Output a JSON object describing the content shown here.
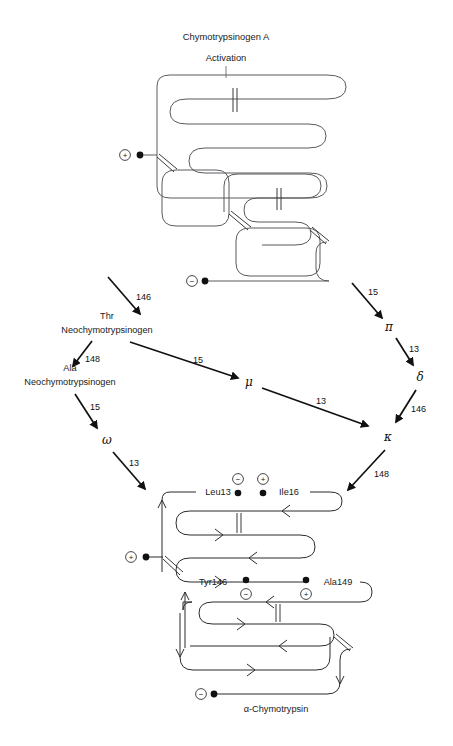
{
  "figure": {
    "title_line1": "Chymotrypsinogen A",
    "title_line2": "Activation",
    "bottom_caption": "α-Chymotrypsin"
  },
  "intermediates": {
    "thr_neo_line1": "Thr",
    "thr_neo_line2": "Neochymotrypsinogen",
    "ala_neo_line1": "Ala",
    "ala_neo_line2": "Neochymotrypsinogen",
    "pi": "π",
    "delta": "δ",
    "mu": "μ",
    "kappa": "κ",
    "omega": "ω"
  },
  "arrow_labels": {
    "zymogen_to_thr": "146",
    "zymogen_to_pi": "15",
    "thr_to_ala": "148",
    "thr_to_mu": "15",
    "ala_to_omega": "15",
    "omega_to_product": "13",
    "pi_to_delta": "13",
    "delta_to_kappa": "146",
    "mu_to_kappa": "13",
    "kappa_to_product": "148"
  },
  "residues": {
    "leu13": "Leu13",
    "ile16": "Ile16",
    "tyr146": "Tyr146",
    "ala149": "Ala149"
  },
  "charges": {
    "plus": "+",
    "minus": "−"
  },
  "colors": {
    "chain": "#5a5a5f",
    "arrow": "#111111",
    "text": "#1a1a1a",
    "background": "#ffffff"
  }
}
